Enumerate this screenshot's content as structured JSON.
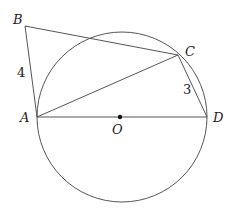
{
  "diagram": {
    "type": "geometry",
    "points": {
      "A": {
        "label": "A",
        "x": 37,
        "y": 117
      },
      "B": {
        "label": "B",
        "x": 25,
        "y": 26
      },
      "C": {
        "label": "C",
        "x": 178,
        "y": 55
      },
      "D": {
        "label": "D",
        "x": 207,
        "y": 117
      },
      "O": {
        "label": "O",
        "x": 120,
        "y": 117
      }
    },
    "circle": {
      "center": "O",
      "cx": 122,
      "cy": 117,
      "r": 85
    },
    "segments": [
      "AB",
      "BC",
      "AC",
      "CD",
      "AD"
    ],
    "lengths": {
      "AB": "4",
      "CD": "3"
    },
    "colors": {
      "stroke": "#555555",
      "text": "#222222"
    }
  }
}
